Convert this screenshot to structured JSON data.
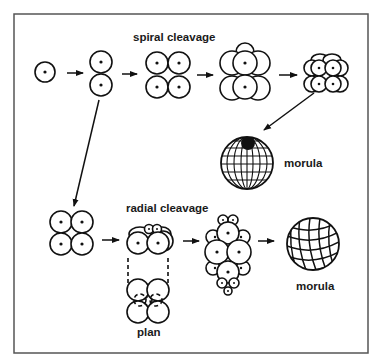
{
  "diagram": {
    "border_color": "#555555",
    "ink_color": "#111111",
    "labels": {
      "spiral": "spiral cleavage",
      "radial": "radial cleavage",
      "morula_spiral": "morula",
      "morula_radial": "morula",
      "plan": "plan"
    },
    "spiral_row": [
      {
        "stage": "1-cell"
      },
      {
        "stage": "2-cell"
      },
      {
        "stage": "4-cell"
      },
      {
        "stage": "8-cell"
      },
      {
        "stage": "16-cell"
      },
      {
        "stage": "morula"
      }
    ],
    "radial_row": [
      {
        "stage": "4-cell"
      },
      {
        "stage": "8-cell"
      },
      {
        "stage": "8-cell plan view"
      },
      {
        "stage": "32-cell"
      },
      {
        "stage": "morula"
      }
    ]
  }
}
